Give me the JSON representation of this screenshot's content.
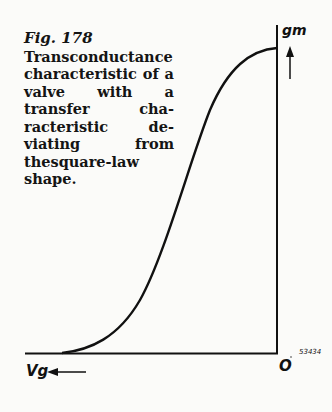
{
  "figure": {
    "number_label": "Fig. 178",
    "caption_lines": [
      "Transconductance",
      "characteristic of a",
      "valve with a",
      "transfer cha-",
      "racteristic de-",
      "viating from",
      "thesquare-law",
      "shape."
    ],
    "caption": "Transconductance characteristic of a valve with a transfer characteristic deviating from the square-law shape.",
    "y_axis_label": "gm",
    "x_axis_label": "Vg",
    "origin_label": "O",
    "drawing_number": "53434"
  }
}
